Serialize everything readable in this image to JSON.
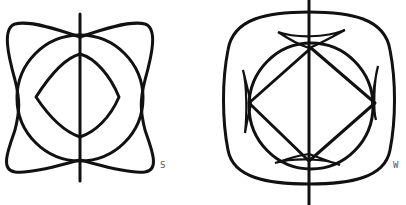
{
  "figures": [
    {
      "id": "left",
      "label": "S"
    },
    {
      "id": "right",
      "label": "W"
    }
  ],
  "colors": {
    "ink": "#111111",
    "background": "#ffffff",
    "label": "#555555"
  }
}
